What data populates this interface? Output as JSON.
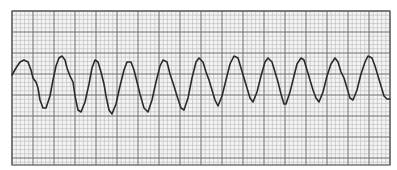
{
  "strip": {
    "description": "ECG rhythm strip on grid paper",
    "grid": {
      "left": 12,
      "top": 11,
      "right": 390,
      "bottom": 165,
      "small_square_px": 4.2,
      "large_square_px": 21,
      "minor_color": "#b8b8b8",
      "major_color": "#6e6e6e",
      "border_color": "#555555",
      "background": "#f4f4f4"
    },
    "trace": {
      "color": "#2a2a2a",
      "width": 1.6,
      "points": [
        [
          12,
          75
        ],
        [
          16,
          68
        ],
        [
          20,
          62
        ],
        [
          24,
          60
        ],
        [
          28,
          62
        ],
        [
          31,
          70
        ],
        [
          33,
          78
        ],
        [
          36,
          82
        ],
        [
          38,
          88
        ],
        [
          40,
          100
        ],
        [
          43,
          108
        ],
        [
          46,
          108
        ],
        [
          50,
          96
        ],
        [
          53,
          80
        ],
        [
          56,
          66
        ],
        [
          59,
          58
        ],
        [
          62,
          56
        ],
        [
          65,
          60
        ],
        [
          67,
          68
        ],
        [
          70,
          76
        ],
        [
          73,
          82
        ],
        [
          75,
          96
        ],
        [
          78,
          110
        ],
        [
          81,
          112
        ],
        [
          85,
          102
        ],
        [
          89,
          84
        ],
        [
          92,
          68
        ],
        [
          95,
          60
        ],
        [
          98,
          62
        ],
        [
          101,
          72
        ],
        [
          104,
          84
        ],
        [
          106,
          96
        ],
        [
          109,
          110
        ],
        [
          112,
          114
        ],
        [
          116,
          104
        ],
        [
          120,
          86
        ],
        [
          124,
          70
        ],
        [
          127,
          62
        ],
        [
          131,
          62
        ],
        [
          134,
          70
        ],
        [
          137,
          82
        ],
        [
          140,
          94
        ],
        [
          144,
          108
        ],
        [
          148,
          112
        ],
        [
          152,
          100
        ],
        [
          156,
          82
        ],
        [
          160,
          66
        ],
        [
          163,
          60
        ],
        [
          167,
          62
        ],
        [
          170,
          74
        ],
        [
          174,
          86
        ],
        [
          177,
          96
        ],
        [
          181,
          108
        ],
        [
          184,
          110
        ],
        [
          188,
          98
        ],
        [
          192,
          78
        ],
        [
          196,
          62
        ],
        [
          199,
          58
        ],
        [
          203,
          62
        ],
        [
          206,
          72
        ],
        [
          209,
          80
        ],
        [
          212,
          90
        ],
        [
          215,
          100
        ],
        [
          218,
          106
        ],
        [
          222,
          96
        ],
        [
          226,
          80
        ],
        [
          230,
          64
        ],
        [
          234,
          56
        ],
        [
          238,
          58
        ],
        [
          241,
          68
        ],
        [
          244,
          78
        ],
        [
          247,
          88
        ],
        [
          250,
          98
        ],
        [
          253,
          102
        ],
        [
          257,
          92
        ],
        [
          261,
          76
        ],
        [
          265,
          62
        ],
        [
          268,
          58
        ],
        [
          272,
          62
        ],
        [
          275,
          72
        ],
        [
          278,
          82
        ],
        [
          281,
          94
        ],
        [
          284,
          104
        ],
        [
          286,
          104
        ],
        [
          290,
          92
        ],
        [
          294,
          76
        ],
        [
          297,
          64
        ],
        [
          301,
          58
        ],
        [
          304,
          60
        ],
        [
          307,
          70
        ],
        [
          310,
          80
        ],
        [
          313,
          90
        ],
        [
          316,
          98
        ],
        [
          319,
          102
        ],
        [
          323,
          92
        ],
        [
          327,
          76
        ],
        [
          331,
          64
        ],
        [
          335,
          58
        ],
        [
          338,
          62
        ],
        [
          341,
          72
        ],
        [
          344,
          78
        ],
        [
          347,
          88
        ],
        [
          350,
          98
        ],
        [
          353,
          100
        ],
        [
          357,
          90
        ],
        [
          361,
          74
        ],
        [
          365,
          62
        ],
        [
          368,
          56
        ],
        [
          372,
          58
        ],
        [
          375,
          66
        ],
        [
          378,
          76
        ],
        [
          381,
          86
        ],
        [
          384,
          96
        ],
        [
          387,
          99
        ],
        [
          390,
          99
        ]
      ]
    }
  }
}
